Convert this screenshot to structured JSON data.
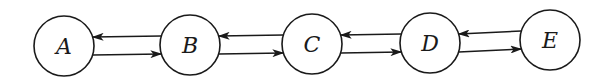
{
  "diagram": {
    "type": "state-chain",
    "nodes": [
      {
        "id": "A",
        "label": "A",
        "cx": 64,
        "cy": 46,
        "r": 30
      },
      {
        "id": "B",
        "label": "B",
        "cx": 190,
        "cy": 45,
        "r": 30
      },
      {
        "id": "C",
        "label": "C",
        "cx": 312,
        "cy": 44,
        "r": 30
      },
      {
        "id": "D",
        "label": "D",
        "cx": 430,
        "cy": 43,
        "r": 30
      },
      {
        "id": "E",
        "label": "E",
        "cx": 550,
        "cy": 40,
        "r": 30
      }
    ],
    "edges": [
      {
        "from": "A",
        "to": "B"
      },
      {
        "from": "B",
        "to": "A"
      },
      {
        "from": "B",
        "to": "C"
      },
      {
        "from": "C",
        "to": "B"
      },
      {
        "from": "C",
        "to": "D"
      },
      {
        "from": "D",
        "to": "C"
      },
      {
        "from": "D",
        "to": "E"
      },
      {
        "from": "E",
        "to": "D"
      }
    ],
    "colors": {
      "stroke": "#1a1a1a",
      "background": "#ffffff"
    }
  }
}
